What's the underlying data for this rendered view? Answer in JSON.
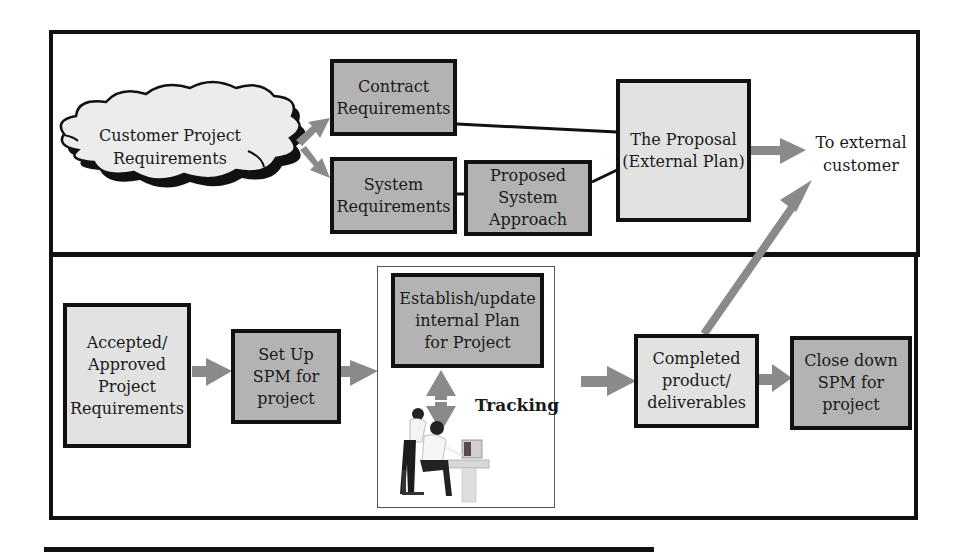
{
  "diagram": {
    "top_section": {
      "cloud": {
        "label": "Customer Project\nRequirements"
      },
      "contract_requirements": {
        "label": "Contract\nRequirements"
      },
      "system_requirements": {
        "label": "System\nRequirements"
      },
      "proposed_system_approach": {
        "label": "Proposed\nSystem\nApproach"
      },
      "proposal": {
        "label": "The Proposal\n(External Plan)"
      },
      "external_customer": {
        "label": "To external\ncustomer"
      }
    },
    "bottom_section": {
      "accepted_requirements": {
        "label": "Accepted/\nApproved\nProject\nRequirements"
      },
      "setup_spm": {
        "label": "Set Up\nSPM for\nproject"
      },
      "internal_plan": {
        "label": "Establish/update\ninternal Plan\nfor Project"
      },
      "tracking": {
        "label": "Tracking"
      },
      "completed_product": {
        "label": "Completed\nproduct/\ndeliverables"
      },
      "close_down": {
        "label": "Close down\nSPM for\nproject"
      }
    },
    "colors": {
      "dark_box": "#b3b3b3",
      "light_box": "#e2e2e2",
      "arrow": "#8a8a8a",
      "border": "#111111"
    }
  }
}
